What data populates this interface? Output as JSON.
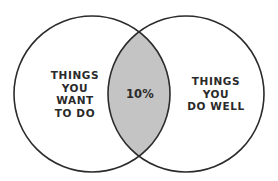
{
  "diagram": {
    "type": "venn",
    "left_set": {
      "lines": [
        "THINGS",
        "YOU",
        "WANT",
        "TO DO"
      ]
    },
    "right_set": {
      "lines": [
        "THINGS",
        "YOU",
        "DO WELL"
      ]
    },
    "overlap": {
      "label": "10%"
    },
    "colors": {
      "stroke": "#2b2b2b",
      "overlap_fill": "#c4c4c4",
      "background": "#ffffff",
      "text": "#2a2a2a"
    }
  }
}
